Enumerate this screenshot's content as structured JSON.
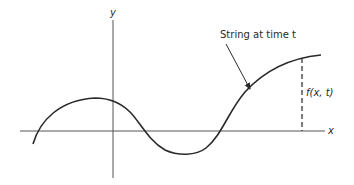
{
  "diagram": {
    "type": "wave-string-displacement",
    "axes": {
      "x_label": "x",
      "y_label": "y"
    },
    "annotations": {
      "string_label": "String at time t",
      "displacement_label": "f(x, t)"
    },
    "colors": {
      "stroke": "#2a2a2a",
      "axis": "#555555",
      "background": "#ffffff"
    }
  }
}
